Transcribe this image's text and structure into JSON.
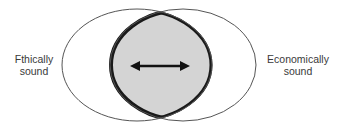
{
  "diagram": {
    "type": "venn",
    "sets": [
      {
        "id": "ethical",
        "label_line1": "Fthically",
        "label_line2": "sound"
      },
      {
        "id": "economic",
        "label_line1": "Economically",
        "label_line2": "sound"
      }
    ],
    "overlap": {
      "fill": "#d4d4d4",
      "border": "#1a1a1a",
      "arrow": "double-headed horizontal"
    },
    "colors": {
      "outline": "#555555",
      "overlap_fill": "#d4d4d4",
      "overlap_border": "#1a1a1a",
      "arrow": "#111111",
      "text": "#3a3a3a"
    }
  }
}
